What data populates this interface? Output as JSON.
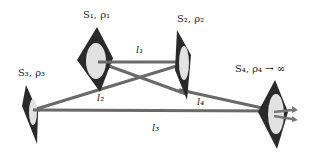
{
  "diagram": {
    "nodes": [
      {
        "id": "S1",
        "label": "S₁, ρ₁"
      },
      {
        "id": "S2",
        "label": "S₂, ρ₂"
      },
      {
        "id": "S3",
        "label": "S₃, ρ₃"
      },
      {
        "id": "S4",
        "label": "S₄, ρ₄ → ∞"
      }
    ],
    "edges": [
      {
        "id": "l1",
        "label": "l₁",
        "from": "S1",
        "to": "S2"
      },
      {
        "id": "l2",
        "label": "l₂",
        "from": "S3",
        "to": "S2"
      },
      {
        "id": "l3",
        "label": "l₃",
        "from": "S3",
        "to": "S4"
      },
      {
        "id": "l4",
        "label": "l₄",
        "from": "S1",
        "to": "S4"
      }
    ],
    "colors": {
      "surface_fill": "#2a2a2a",
      "surface_spot": "#e2e2e2",
      "line": "#6a6a6a",
      "arrow": "#777777"
    }
  }
}
